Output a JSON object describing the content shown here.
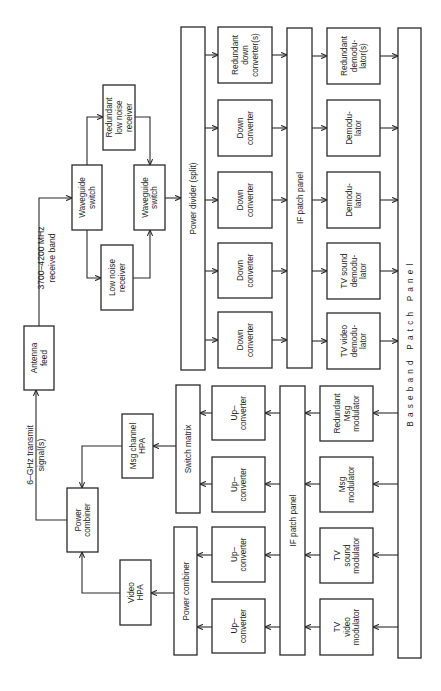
{
  "diagram": {
    "colors": {
      "line": "#2a2a2a",
      "text": "#1e1e1e",
      "background": "#ffffff"
    },
    "annotations": {
      "receive_band": {
        "line1": "3700–4200 MHz",
        "line2": "receive band"
      },
      "transmit": {
        "line1": "6–GHz transmit",
        "line2": "signal(s)"
      }
    },
    "blocks": [
      {
        "id": "antenna-feed",
        "x": 24,
        "y": 326,
        "w": 30,
        "h": 64,
        "lines": [
          "Antenna",
          "feed"
        ]
      },
      {
        "id": "waveguide-switch-1",
        "x": 72,
        "y": 165,
        "w": 30,
        "h": 65,
        "lines": [
          "Waveguide",
          "switch"
        ]
      },
      {
        "id": "low-noise-receiver",
        "x": 101,
        "y": 245,
        "w": 32,
        "h": 65,
        "lines": [
          "Low  noise",
          "receiver"
        ]
      },
      {
        "id": "redundant-low-noise-receiver",
        "x": 103,
        "y": 85,
        "w": 32,
        "h": 65,
        "lines": [
          "Redundant",
          "low  noise",
          "receiver"
        ]
      },
      {
        "id": "waveguide-switch-2",
        "x": 134,
        "y": 165,
        "w": 31,
        "h": 65,
        "lines": [
          "Waveguide",
          "switch"
        ]
      },
      {
        "id": "power-divider",
        "x": 181,
        "y": 27,
        "w": 24,
        "h": 343,
        "lines": [
          "Power  divider  (split)"
        ]
      },
      {
        "id": "down-converter-redundant",
        "x": 218,
        "y": 27,
        "w": 54,
        "h": 56,
        "lines": [
          "Redundant",
          "down",
          "converter(s)"
        ]
      },
      {
        "id": "down-converter-4",
        "x": 218,
        "y": 100,
        "w": 54,
        "h": 56,
        "lines": [
          "Down",
          "converter"
        ]
      },
      {
        "id": "down-converter-3",
        "x": 218,
        "y": 172,
        "w": 54,
        "h": 56,
        "lines": [
          "Down",
          "converter"
        ]
      },
      {
        "id": "down-converter-2",
        "x": 218,
        "y": 243,
        "w": 54,
        "h": 55,
        "lines": [
          "Down",
          "converter"
        ]
      },
      {
        "id": "down-converter-1",
        "x": 218,
        "y": 312,
        "w": 54,
        "h": 56,
        "lines": [
          "Down",
          "converter"
        ]
      },
      {
        "id": "if-patch-panel-rx",
        "x": 287,
        "y": 28,
        "w": 25,
        "h": 340,
        "lines": [
          "IF  patch  panel"
        ]
      },
      {
        "id": "demodulator-redundant",
        "x": 327,
        "y": 28,
        "w": 53,
        "h": 56,
        "lines": [
          "Redundant",
          "demodu-",
          "lator(s)"
        ]
      },
      {
        "id": "demodulator-2",
        "x": 327,
        "y": 100,
        "w": 53,
        "h": 56,
        "lines": [
          "Demodu-",
          "lator"
        ]
      },
      {
        "id": "demodulator-1",
        "x": 327,
        "y": 172,
        "w": 53,
        "h": 56,
        "lines": [
          "Demodu-",
          "lator"
        ]
      },
      {
        "id": "tv-sound-demodulator",
        "x": 327,
        "y": 243,
        "w": 53,
        "h": 56,
        "lines": [
          "TV  sound",
          "demodu-",
          "lator"
        ]
      },
      {
        "id": "tv-video-demodulator",
        "x": 327,
        "y": 313,
        "w": 53,
        "h": 56,
        "lines": [
          "TV  video",
          "demodu-",
          "lator"
        ]
      },
      {
        "id": "baseband-patch-panel",
        "x": 398,
        "y": 28,
        "w": 23,
        "h": 630,
        "lines": [
          "Baseband Patch Panel"
        ],
        "wide": true
      },
      {
        "id": "switch-matrix",
        "x": 176,
        "y": 385,
        "w": 24,
        "h": 128,
        "lines": [
          "Switch  matrix"
        ]
      },
      {
        "id": "power-combiner-tx",
        "x": 174,
        "y": 527,
        "w": 23,
        "h": 128,
        "lines": [
          "Power  combiner"
        ]
      },
      {
        "id": "up-converter-4",
        "x": 212,
        "y": 386,
        "w": 53,
        "h": 54,
        "lines": [
          "Up–",
          "converter"
        ]
      },
      {
        "id": "up-converter-3",
        "x": 212,
        "y": 457,
        "w": 53,
        "h": 55,
        "lines": [
          "Up–",
          "converter"
        ]
      },
      {
        "id": "up-converter-2",
        "x": 212,
        "y": 527,
        "w": 53,
        "h": 55,
        "lines": [
          "Up–",
          "converter"
        ]
      },
      {
        "id": "up-converter-1",
        "x": 212,
        "y": 599,
        "w": 53,
        "h": 54,
        "lines": [
          "Up–",
          "converter"
        ]
      },
      {
        "id": "if-patch-panel-tx",
        "x": 280,
        "y": 386,
        "w": 25,
        "h": 269,
        "lines": [
          "IF  patch  panel"
        ]
      },
      {
        "id": "redundant-msg-modulator",
        "x": 320,
        "y": 386,
        "w": 53,
        "h": 55,
        "lines": [
          "Redundant",
          "Msg",
          "modulator"
        ]
      },
      {
        "id": "msg-modulator",
        "x": 320,
        "y": 457,
        "w": 53,
        "h": 55,
        "lines": [
          "Msg",
          "modulator"
        ]
      },
      {
        "id": "tv-sound-modulator",
        "x": 320,
        "y": 528,
        "w": 53,
        "h": 55,
        "lines": [
          "TV",
          "sound",
          "modulator"
        ]
      },
      {
        "id": "tv-video-modulator",
        "x": 320,
        "y": 599,
        "w": 53,
        "h": 56,
        "lines": [
          "TV",
          "video",
          "modulator"
        ]
      },
      {
        "id": "msg-channel-hpa",
        "x": 122,
        "y": 414,
        "w": 31,
        "h": 64,
        "lines": [
          "Msg  channel",
          "HPA"
        ]
      },
      {
        "id": "power-combiner",
        "x": 67,
        "y": 488,
        "w": 31,
        "h": 64,
        "lines": [
          "Power",
          "combiner"
        ]
      },
      {
        "id": "video-hpa",
        "x": 120,
        "y": 560,
        "w": 31,
        "h": 65,
        "lines": [
          "Video",
          "HPA"
        ]
      }
    ],
    "wires": [
      {
        "d": "M39,326 L39,198 L72,198",
        "arrow_end": true
      },
      {
        "d": "M87,165 L87,117 L103,117",
        "arrow_end": true
      },
      {
        "d": "M87,230 L87,278 L101,278",
        "arrow_end": true
      },
      {
        "d": "M135,117 L150,117 L150,165",
        "arrow_end": true
      },
      {
        "d": "M133,278 L150,278 L150,230",
        "arrow_end": true
      },
      {
        "d": "M165,198 L181,198",
        "arrow_end": true
      },
      {
        "d": "M205,55 L218,55",
        "arrow_end": true
      },
      {
        "d": "M205,128 L218,128",
        "arrow_end": true
      },
      {
        "d": "M205,200 L218,200",
        "arrow_end": true
      },
      {
        "d": "M205,271 L218,271",
        "arrow_end": true
      },
      {
        "d": "M205,340 L218,340",
        "arrow_end": true
      },
      {
        "d": "M272,55 L287,55",
        "arrow_end": true
      },
      {
        "d": "M272,128 L287,128",
        "arrow_end": true
      },
      {
        "d": "M272,200 L287,200",
        "arrow_end": true
      },
      {
        "d": "M272,271 L287,271",
        "arrow_end": true
      },
      {
        "d": "M272,340 L287,340",
        "arrow_end": true
      },
      {
        "d": "M312,56 L327,56",
        "arrow_end": true
      },
      {
        "d": "M312,128 L327,128",
        "arrow_end": true
      },
      {
        "d": "M312,200 L327,200",
        "arrow_end": true
      },
      {
        "d": "M312,271 L327,271",
        "arrow_end": true
      },
      {
        "d": "M312,341 L327,341",
        "arrow_end": true
      },
      {
        "d": "M380,56 L398,56",
        "arrow_end": true
      },
      {
        "d": "M380,128 L398,128",
        "arrow_end": true
      },
      {
        "d": "M380,200 L398,200",
        "arrow_end": true
      },
      {
        "d": "M380,271 L398,271",
        "arrow_end": true
      },
      {
        "d": "M380,341 L398,341",
        "arrow_end": true
      },
      {
        "d": "M398,413 L373,413",
        "arrow_end": true
      },
      {
        "d": "M398,484 L373,484",
        "arrow_end": true
      },
      {
        "d": "M398,555 L373,555",
        "arrow_end": true
      },
      {
        "d": "M398,627 L373,627",
        "arrow_end": true
      },
      {
        "d": "M320,413 L305,413",
        "arrow_end": true
      },
      {
        "d": "M320,484 L305,484",
        "arrow_end": true
      },
      {
        "d": "M320,555 L305,555",
        "arrow_end": true
      },
      {
        "d": "M320,627 L305,627",
        "arrow_end": true
      },
      {
        "d": "M280,413 L265,413",
        "arrow_end": true
      },
      {
        "d": "M280,484 L265,484",
        "arrow_end": true
      },
      {
        "d": "M280,555 L265,555",
        "arrow_end": true
      },
      {
        "d": "M280,627 L265,627",
        "arrow_end": true
      },
      {
        "d": "M212,413 L200,413",
        "arrow_end": true
      },
      {
        "d": "M212,484 L200,484",
        "arrow_end": true
      },
      {
        "d": "M212,555 L197,555",
        "arrow_end": true
      },
      {
        "d": "M212,627 L197,627",
        "arrow_end": true
      },
      {
        "d": "M176,446 L153,446",
        "arrow_end": true
      },
      {
        "d": "M122,446 L82,446 L82,488",
        "arrow_end": true
      },
      {
        "d": "M174,593 L151,593",
        "arrow_end": true
      },
      {
        "d": "M120,593 L82,593 L82,552",
        "arrow_end": true
      },
      {
        "d": "M67,520 L36,520 L36,390",
        "arrow_end": true
      }
    ]
  }
}
